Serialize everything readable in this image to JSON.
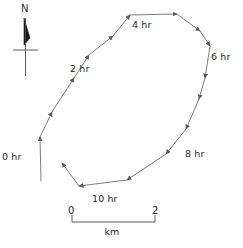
{
  "figure": {
    "type": "trajectory-map",
    "background_color": "#ffffff",
    "line_color": "#6e6e6e",
    "text_color": "#2b2b2b"
  },
  "compass": {
    "label": "N",
    "icon": "north-arrow-icon"
  },
  "time_labels": [
    {
      "text": "0 hr",
      "x": 2,
      "y": 151
    },
    {
      "text": "2 hr",
      "x": 70,
      "y": 63
    },
    {
      "text": "4 hr",
      "x": 132,
      "y": 19
    },
    {
      "text": "6 hr",
      "x": 211,
      "y": 51
    },
    {
      "text": "8 hr",
      "x": 185,
      "y": 148
    },
    {
      "text": "10 hr",
      "x": 92,
      "y": 193
    }
  ],
  "scalebar": {
    "left_label": "0",
    "right_label": "2",
    "unit_label": "km",
    "x_start": 72,
    "x_end": 155,
    "y": 222
  },
  "chart_data": {
    "type": "line",
    "title": "",
    "xlabel": "km",
    "ylabel": "",
    "series": [
      {
        "name": "track",
        "points": [
          {
            "x": 41,
            "y": 181,
            "label": "0 hr"
          },
          {
            "x": 40,
            "y": 137,
            "label": ""
          },
          {
            "x": 52,
            "y": 112,
            "label": ""
          },
          {
            "x": 74,
            "y": 78,
            "label": "2 hr"
          },
          {
            "x": 89,
            "y": 55,
            "label": ""
          },
          {
            "x": 113,
            "y": 36,
            "label": ""
          },
          {
            "x": 130,
            "y": 15,
            "label": "4 hr"
          },
          {
            "x": 177,
            "y": 14,
            "label": ""
          },
          {
            "x": 200,
            "y": 31,
            "label": ""
          },
          {
            "x": 210,
            "y": 46,
            "label": "6 hr"
          },
          {
            "x": 205,
            "y": 78,
            "label": ""
          },
          {
            "x": 199,
            "y": 99,
            "label": ""
          },
          {
            "x": 186,
            "y": 129,
            "label": "8 hr"
          },
          {
            "x": 166,
            "y": 154,
            "label": ""
          },
          {
            "x": 127,
            "y": 180,
            "label": ""
          },
          {
            "x": 79,
            "y": 186,
            "label": "10 hr"
          },
          {
            "x": 62,
            "y": 163,
            "label": ""
          }
        ]
      }
    ]
  }
}
